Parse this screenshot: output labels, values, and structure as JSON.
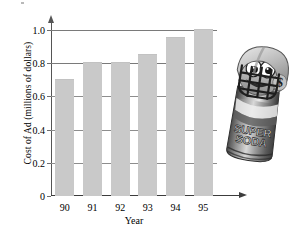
{
  "chart_data": {
    "type": "bar",
    "title": "",
    "xlabel": "Year",
    "ylabel": "Cost of Ad (millions of dollars)",
    "categories": [
      "90",
      "91",
      "92",
      "93",
      "94",
      "95"
    ],
    "values": [
      0.7,
      0.8,
      0.8,
      0.85,
      0.95,
      1.0
    ],
    "series": [
      {
        "name": "Cost of Ad",
        "values": [
          0.7,
          0.8,
          0.8,
          0.85,
          0.95,
          1.0
        ]
      }
    ],
    "ylim": [
      0,
      1.0
    ],
    "yticks": [
      0,
      0.2,
      0.4,
      0.6,
      0.8,
      1.0
    ],
    "ytick_labels": [
      "0",
      "0.2",
      "0.4",
      "0.6",
      "0.8",
      "1.0"
    ],
    "grid": true,
    "legend": "none",
    "bar_color": "#c9c9c9",
    "gridline_color": "#8d8d8d",
    "axis_color": "#555555"
  },
  "illustration": {
    "name": "soda-can-mascot",
    "description": "Cartoon soda can wearing a football helmet",
    "helmet_logo": "$",
    "can_label_line1": "SUPER",
    "can_label_line2": "SODA"
  }
}
